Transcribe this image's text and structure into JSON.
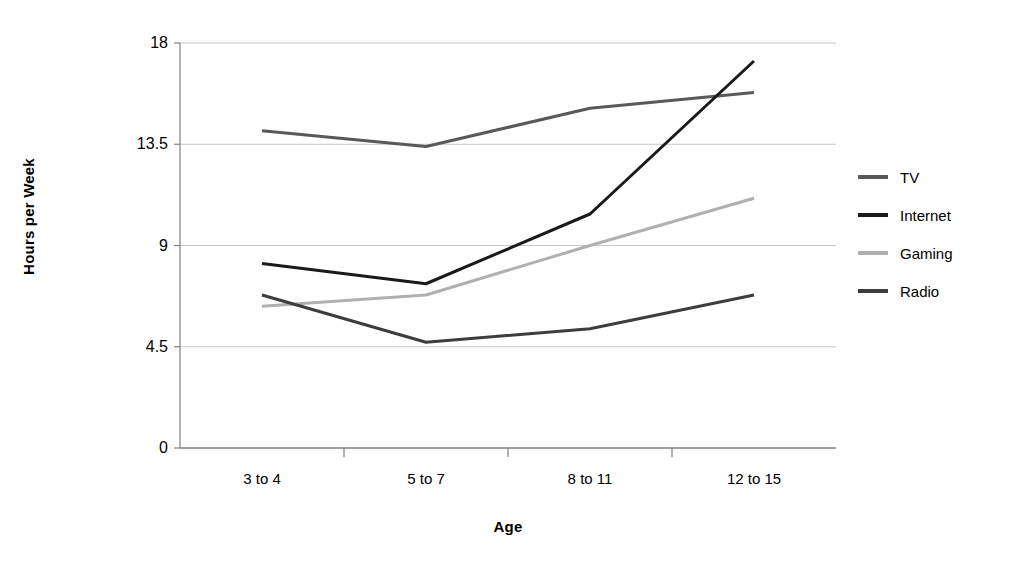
{
  "chart_data": {
    "type": "line",
    "title": "",
    "xlabel": "Age",
    "ylabel": "Hours per Week",
    "categories": [
      "3 to 4",
      "5 to 7",
      "8 to 11",
      "12 to 15"
    ],
    "yticks": [
      "0",
      "4.5",
      "9",
      "13.5",
      "18"
    ],
    "ytick_values": [
      0,
      4.5,
      9,
      13.5,
      18
    ],
    "ylim": [
      0,
      18
    ],
    "grid": "horizontal",
    "legend_position": "right",
    "series": [
      {
        "name": "TV",
        "color": "#595959",
        "values": [
          14.1,
          13.4,
          15.1,
          15.8
        ]
      },
      {
        "name": "Internet",
        "color": "#1a1a1a",
        "values": [
          8.2,
          7.3,
          10.4,
          17.2
        ]
      },
      {
        "name": "Gaming",
        "color": "#b0b0b0",
        "values": [
          6.3,
          6.8,
          9.0,
          11.1
        ]
      },
      {
        "name": "Radio",
        "color": "#3d3d3d",
        "values": [
          6.8,
          4.7,
          5.3,
          6.8
        ]
      }
    ]
  },
  "legend": {
    "items": [
      {
        "label": "TV"
      },
      {
        "label": "Internet"
      },
      {
        "label": "Gaming"
      },
      {
        "label": "Radio"
      }
    ]
  },
  "axes": {
    "y_title": "Hours per Week",
    "x_title": "Age"
  },
  "colors": {
    "grid": "#c8c8c8",
    "axis": "#808080",
    "background": "#ffffff",
    "text": "#000000"
  }
}
